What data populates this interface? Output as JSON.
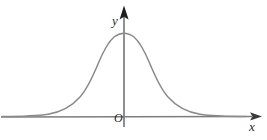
{
  "figure": {
    "kind": "coordinate-plane-with-curve",
    "background_color": "#ffffff",
    "width": 267,
    "height": 140
  },
  "labels": {
    "y_axis": "y",
    "x_axis": "x",
    "origin": "O"
  },
  "colors": {
    "axis": "#7d7d7d",
    "curve": "#8a8a8a",
    "arrow_y": "#1f1f1f",
    "arrow_x": "#3a3a3a",
    "label_text": "#2b2b2b"
  },
  "chart_data": {
    "type": "line",
    "title": "",
    "xlabel": "x",
    "ylabel": "y",
    "grid": false,
    "legend": null,
    "annotations": [
      "O"
    ],
    "axis_style": {
      "x_axis_y_px": 117,
      "y_axis_x_px": 124,
      "x_axis_arrow": "right",
      "y_axis_arrow": "up",
      "ticks": [],
      "tick_labels": []
    },
    "function": "y = a * exp(-(x^2) / (2 * s^2))",
    "peak": {
      "x": 0,
      "y": 1
    },
    "symmetry_axis_x": 0,
    "xlim": [
      -4,
      4
    ],
    "ylim": [
      0,
      1.1
    ],
    "series": [
      {
        "name": "bell-curve",
        "x": [
          -4,
          -3.6,
          -3.2,
          -2.8,
          -2.4,
          -2,
          -1.6,
          -1.2,
          -0.8,
          -0.4,
          0,
          0.4,
          0.8,
          1.2,
          1.6,
          2,
          2.4,
          2.8,
          3.2,
          3.6,
          4
        ],
        "values": [
          0.0,
          0.002,
          0.006,
          0.02,
          0.056,
          0.135,
          0.278,
          0.487,
          0.726,
          0.923,
          1.0,
          0.923,
          0.726,
          0.487,
          0.278,
          0.135,
          0.056,
          0.02,
          0.006,
          0.002,
          0.0
        ]
      }
    ],
    "curve_path_px": "M 2,116.6 C 20,116.4 36,116 48,114.2 C 62,112 72,106 80,97 C 88,88 93,76 98,64 C 103,52 108,42 114,37 C 118,34 121,33.2 124,33.2 C 127,33.2 130,34 134,37 C 140,42 145,52 150,64 C 155,76 160,88 168,97 C 176,106 186,112 200,114.2 C 212,116 228,116.4 246,116.6",
    "curve_geometry_px": {
      "peak_x": 124,
      "peak_y": 33,
      "baseline_y": 117,
      "left_merge_x": 46,
      "right_merge_x": 208,
      "half_width_half_max_px": 28
    }
  }
}
